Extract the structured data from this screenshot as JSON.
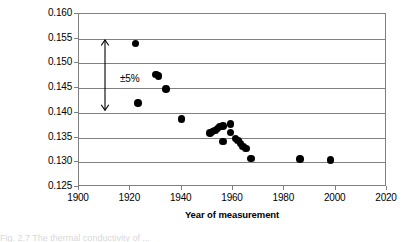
{
  "chart_data": {
    "type": "scatter",
    "title": "",
    "xlabel": "Year of measurement",
    "ylabel": "Thermal conductivity (W/mK)",
    "xlim": [
      1900,
      2020
    ],
    "ylim": [
      0.125,
      0.16
    ],
    "grid": true,
    "legend": "none",
    "x_ticks": [
      1900,
      1920,
      1940,
      1960,
      1980,
      2000,
      2020
    ],
    "x_tick_labels": [
      "1900",
      "1920",
      "1940",
      "1960",
      "1980",
      "2000",
      "2020"
    ],
    "y_ticks": [
      0.125,
      0.13,
      0.135,
      0.14,
      0.145,
      0.15,
      0.155,
      0.16
    ],
    "y_tick_labels": [
      "0.125",
      "0.130",
      "0.135",
      "0.140",
      "0.145",
      "0.150",
      "0.155",
      "0.160"
    ],
    "marker_color": "#000000",
    "grid_color": "#808080",
    "points": [
      {
        "x": 1922,
        "y": 0.154
      },
      {
        "x": 1923,
        "y": 0.142
      },
      {
        "x": 1930,
        "y": 0.1478
      },
      {
        "x": 1931,
        "y": 0.1474
      },
      {
        "x": 1934,
        "y": 0.1448
      },
      {
        "x": 1940,
        "y": 0.1388
      },
      {
        "x": 1951,
        "y": 0.1359
      },
      {
        "x": 1952,
        "y": 0.1362
      },
      {
        "x": 1953,
        "y": 0.1364
      },
      {
        "x": 1954,
        "y": 0.1368
      },
      {
        "x": 1955,
        "y": 0.1372
      },
      {
        "x": 1956,
        "y": 0.1374
      },
      {
        "x": 1956,
        "y": 0.1342
      },
      {
        "x": 1959,
        "y": 0.1378
      },
      {
        "x": 1959,
        "y": 0.136
      },
      {
        "x": 1961,
        "y": 0.1348
      },
      {
        "x": 1962,
        "y": 0.1344
      },
      {
        "x": 1963,
        "y": 0.1338
      },
      {
        "x": 1964,
        "y": 0.1332
      },
      {
        "x": 1965,
        "y": 0.1328
      },
      {
        "x": 1967,
        "y": 0.1308
      },
      {
        "x": 1986,
        "y": 0.1307
      },
      {
        "x": 1998,
        "y": 0.1305
      }
    ],
    "annotations": [
      {
        "type": "double-arrow",
        "label": "±5%",
        "x": 1910,
        "y_top": 0.1547,
        "y_bottom": 0.1405,
        "label_x": 1916,
        "label_y": 0.1468
      }
    ]
  },
  "caption": {
    "text": "Fig. 2.7  The thermal conductivity of ..."
  }
}
